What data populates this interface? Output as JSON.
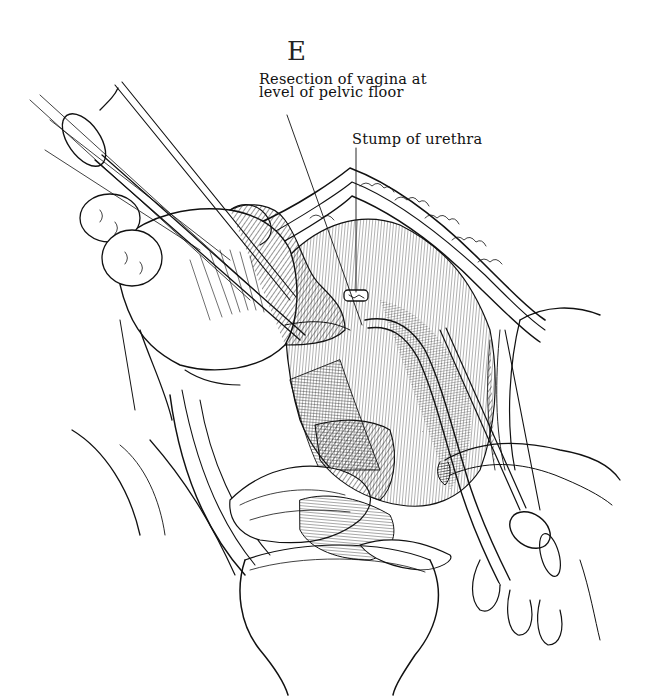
{
  "figure": {
    "panel_letter": "E",
    "type": "surgical line-art illustration",
    "colors": {
      "ink": "#111111",
      "paper": "#ffffff"
    }
  },
  "labels": [
    {
      "id": "resection",
      "line1": "Resection of vagina at",
      "line2": "level of pelvic floor"
    },
    {
      "id": "urethra",
      "text": "Stump of urethra"
    }
  ],
  "depicted_elements": [
    "hand-icon",
    "forceps-icon",
    "retractor-icon",
    "sponge-icon",
    "catheter-icon"
  ]
}
